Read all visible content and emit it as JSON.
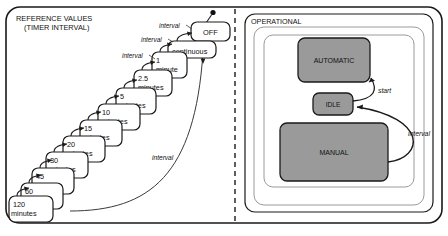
{
  "diagram": {
    "type": "statechart",
    "title_left": "REFERENCE VALUES",
    "subtitle_left": "(TIMER INTERVAL)",
    "title_right": "OPERATIONAL",
    "colors": {
      "state_fill": "#9a9a9a",
      "outline": "#1a1a1a",
      "background": "#ffffff",
      "divider": "#1a1a1a"
    }
  },
  "reference_region": {
    "title": "REFERENCE VALUES",
    "subtitle": "(TIMER INTERVAL)",
    "off_state": "OFF",
    "initial_marker": "initial-state-dot",
    "steps": [
      {
        "value": "continuous",
        "unit": ""
      },
      {
        "value": "1",
        "unit": "minute"
      },
      {
        "value": "2.5",
        "unit": "minutes"
      },
      {
        "value": "5",
        "unit": "minutes"
      },
      {
        "value": "10",
        "unit": "minutes"
      },
      {
        "value": "15",
        "unit": "minutes"
      },
      {
        "value": "20",
        "unit": "minutes"
      },
      {
        "value": "30",
        "unit": "minutes"
      },
      {
        "value": "45",
        "unit": "minutes"
      },
      {
        "value": "60",
        "unit": "minutes"
      },
      {
        "value": "120",
        "unit": "minutes"
      }
    ],
    "transition_labels": [
      "interval",
      "interval",
      "interval",
      "interval"
    ]
  },
  "operational_region": {
    "title": "OPERATIONAL",
    "states": [
      {
        "name": "AUTOMATIC"
      },
      {
        "name": "IDLE"
      },
      {
        "name": "MANUAL"
      }
    ],
    "transitions": [
      {
        "label": "start",
        "from": "IDLE",
        "to": "AUTOMATIC"
      },
      {
        "label": "interval",
        "from": "MANUAL",
        "to": "IDLE"
      }
    ]
  }
}
